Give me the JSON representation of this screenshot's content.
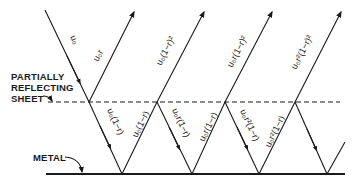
{
  "labels": {
    "sheet_line1": "PARTIALLY",
    "sheet_line2": "REFLECTING",
    "sheet_line3": "SHEET",
    "metal": "METAL"
  },
  "rays": {
    "incident": "u₀",
    "reflected_first": "u₀r",
    "transmitted_down_1": "u₀(1−r)",
    "up_1": "u₀(1−r)",
    "emerging_1": "u₀(1−r)²",
    "down_2": "u₀r(1−r)",
    "up_2": "u₀r(1−r)",
    "emerging_2": "u₀r(1−r)²",
    "down_3": "u₀r²(1−r)",
    "up_3": "u₀r²(1−r)",
    "emerging_3": "u₀r²(1−r)²"
  },
  "colors": {
    "ink": "#1a1a1a",
    "background": "#ffffff"
  }
}
